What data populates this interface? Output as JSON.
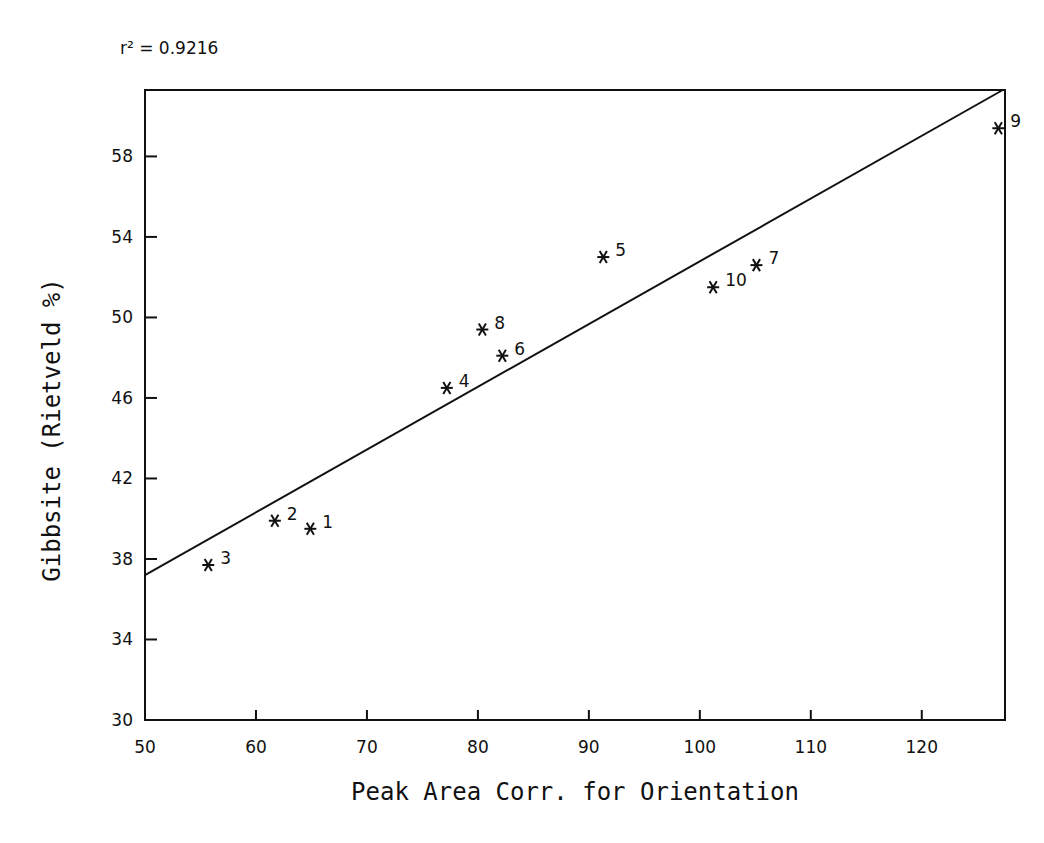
{
  "chart_data": {
    "type": "scatter",
    "title": "",
    "annotation": "r² = 0.9216",
    "xlabel": "Peak Area Corr. for Orientation",
    "ylabel": "Gibbsite (Rietveld %)",
    "xlim": [
      50,
      127.5
    ],
    "ylim": [
      30,
      61.3
    ],
    "x_ticks": [
      50,
      60,
      70,
      80,
      90,
      100,
      110,
      120
    ],
    "y_ticks": [
      30,
      34,
      38,
      42,
      46,
      50,
      54,
      58
    ],
    "grid": false,
    "legend": null,
    "marker": "*",
    "points": [
      {
        "label": "1",
        "x": 64.9,
        "y": 39.5
      },
      {
        "label": "2",
        "x": 61.7,
        "y": 39.9
      },
      {
        "label": "3",
        "x": 55.7,
        "y": 37.7
      },
      {
        "label": "4",
        "x": 77.2,
        "y": 46.5
      },
      {
        "label": "5",
        "x": 91.3,
        "y": 53.0
      },
      {
        "label": "6",
        "x": 82.2,
        "y": 48.1
      },
      {
        "label": "7",
        "x": 105.1,
        "y": 52.6
      },
      {
        "label": "8",
        "x": 80.4,
        "y": 49.4
      },
      {
        "label": "9",
        "x": 126.9,
        "y": 59.4
      },
      {
        "label": "10",
        "x": 101.2,
        "y": 51.5
      }
    ],
    "regression_line": {
      "x": [
        50,
        127.3
      ],
      "y": [
        37.2,
        61.3
      ]
    }
  },
  "colors": {
    "ink": "#111111",
    "background": "#ffffff"
  }
}
